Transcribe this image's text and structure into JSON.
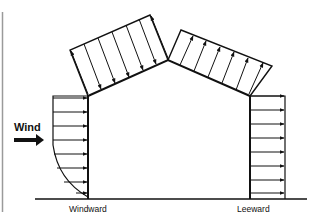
{
  "diagram": {
    "labels": {
      "wind": "Wind",
      "windward": "Windward",
      "leeward": "Leeward"
    },
    "colors": {
      "line": "#111111",
      "frame": "#9a9a9a",
      "background": "#ffffff"
    },
    "elements": [
      {
        "name": "ground-line",
        "type": "line"
      },
      {
        "name": "building-outline",
        "type": "gable-frame"
      },
      {
        "name": "windward-wall-pressure",
        "type": "arrow-distribution",
        "arrows": 8,
        "profile": "curved"
      },
      {
        "name": "windward-roof-pressure",
        "type": "arrow-distribution",
        "arrows": 7,
        "direction": "toward-roof"
      },
      {
        "name": "leeward-roof-pressure",
        "type": "arrow-distribution",
        "arrows": 7,
        "direction": "away-from-roof"
      },
      {
        "name": "leeward-wall-pressure",
        "type": "arrow-distribution",
        "arrows": 8,
        "profile": "uniform"
      },
      {
        "name": "wind-direction-arrow",
        "type": "arrow"
      }
    ]
  }
}
